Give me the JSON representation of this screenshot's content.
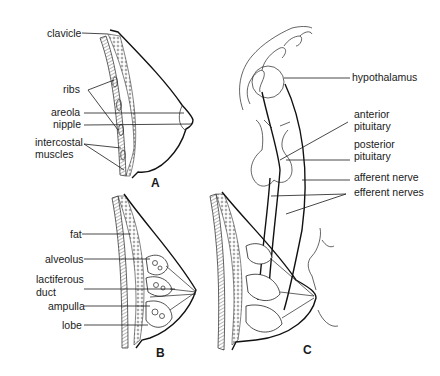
{
  "figure": {
    "panels": [
      {
        "id": "A",
        "label": "A"
      },
      {
        "id": "B",
        "label": "B"
      },
      {
        "id": "C",
        "label": "C"
      }
    ],
    "panel_a": {
      "labels": {
        "clavicle": "clavicle",
        "ribs": "ribs",
        "areola": "areola",
        "nipple": "nipple",
        "intercostal_1": "intercostal",
        "intercostal_2": "muscles"
      }
    },
    "panel_b": {
      "labels": {
        "fat": "fat",
        "alveolus": "alveolus",
        "lactiferous_1": "lactiferous",
        "lactiferous_2": "duct",
        "ampulla": "ampulla",
        "lobe": "lobe"
      }
    },
    "panel_c": {
      "labels": {
        "hypothalamus": "hypothalamus",
        "anterior_1": "anterior",
        "anterior_2": "pituitary",
        "posterior_1": "posterior",
        "posterior_2": "pituitary",
        "afferent": "afferent nerve",
        "efferent": "efferent nerves"
      }
    }
  }
}
